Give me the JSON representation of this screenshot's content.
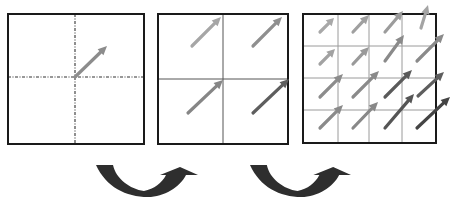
{
  "diagram": {
    "colors": {
      "border": "#1a1a1a",
      "grid_line": "#555555",
      "grid_line_fine": "#9a9a9a",
      "transition_arrow": "#2e2e2e"
    },
    "panels": [
      {
        "id": "level-0",
        "box": [
          8,
          14,
          144,
          144
        ],
        "divider_style": "dashdot",
        "dividers": {
          "v": [
            75
          ],
          "h": [
            77
          ]
        },
        "arrows": [
          {
            "x1": 75,
            "y1": 77,
            "x2": 107,
            "y2": 46,
            "color": "#8c8c8c"
          }
        ]
      },
      {
        "id": "level-1",
        "box": [
          158,
          14,
          288,
          144
        ],
        "divider_style": "solid",
        "dividers": {
          "v": [
            223
          ],
          "h": [
            79
          ]
        },
        "arrows": [
          {
            "x1": 192,
            "y1": 46,
            "x2": 221,
            "y2": 17,
            "color": "#a6a6a6"
          },
          {
            "x1": 253,
            "y1": 46,
            "x2": 282,
            "y2": 17,
            "color": "#8f8f8f"
          },
          {
            "x1": 188,
            "y1": 113,
            "x2": 223,
            "y2": 80,
            "color": "#868686"
          },
          {
            "x1": 253,
            "y1": 113,
            "x2": 289,
            "y2": 79,
            "color": "#5e5e5e"
          }
        ]
      },
      {
        "id": "level-2",
        "box": [
          303,
          14,
          436,
          143
        ],
        "divider_style": "solid",
        "dividers": {
          "v": [
            338,
            369,
            402
          ],
          "h": [
            46,
            78,
            110
          ]
        },
        "arrows": [
          {
            "x1": 320,
            "y1": 32,
            "x2": 334,
            "y2": 18,
            "color": "#a8a8a8"
          },
          {
            "x1": 353,
            "y1": 32,
            "x2": 369,
            "y2": 15,
            "color": "#a0a0a0"
          },
          {
            "x1": 385,
            "y1": 32,
            "x2": 403,
            "y2": 11,
            "color": "#9c9c9c"
          },
          {
            "x1": 421,
            "y1": 28,
            "x2": 428,
            "y2": 5,
            "color": "#a4a4a4"
          },
          {
            "x1": 320,
            "y1": 64,
            "x2": 335,
            "y2": 49,
            "color": "#a2a2a2"
          },
          {
            "x1": 353,
            "y1": 64,
            "x2": 369,
            "y2": 47,
            "color": "#9a9a9a"
          },
          {
            "x1": 385,
            "y1": 61,
            "x2": 404,
            "y2": 35,
            "color": "#8a8a8a"
          },
          {
            "x1": 417,
            "y1": 61,
            "x2": 444,
            "y2": 34,
            "color": "#8a8a8a"
          },
          {
            "x1": 320,
            "y1": 97,
            "x2": 343,
            "y2": 74,
            "color": "#8c8c8c"
          },
          {
            "x1": 353,
            "y1": 97,
            "x2": 379,
            "y2": 71,
            "color": "#8a8a8a"
          },
          {
            "x1": 385,
            "y1": 97,
            "x2": 412,
            "y2": 70,
            "color": "#5a5a5a"
          },
          {
            "x1": 418,
            "y1": 96,
            "x2": 444,
            "y2": 72,
            "color": "#5e5e5e"
          },
          {
            "x1": 320,
            "y1": 128,
            "x2": 343,
            "y2": 105,
            "color": "#8a8a8a"
          },
          {
            "x1": 353,
            "y1": 128,
            "x2": 378,
            "y2": 102,
            "color": "#888888"
          },
          {
            "x1": 385,
            "y1": 128,
            "x2": 414,
            "y2": 94,
            "color": "#555555"
          },
          {
            "x1": 417,
            "y1": 128,
            "x2": 450,
            "y2": 97,
            "color": "#444444"
          }
        ]
      }
    ],
    "transitions": [
      {
        "id": "refine-1",
        "x": 96,
        "y": 165,
        "w": 102,
        "h": 32
      },
      {
        "id": "refine-2",
        "x": 250,
        "y": 165,
        "w": 101,
        "h": 32
      }
    ]
  }
}
